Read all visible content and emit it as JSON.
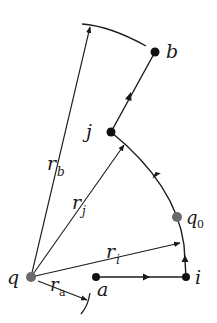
{
  "diagram": {
    "type": "physics-path-diagram",
    "colors": {
      "line": "#1a1a1a",
      "point_black": "#111111",
      "point_gray": "#6b6b6b",
      "background": "#ffffff"
    },
    "points": {
      "q": {
        "label": "q",
        "x": 31,
        "y": 277,
        "color": "gray"
      },
      "q0": {
        "label": "q",
        "sub": "0",
        "x": 177,
        "y": 217,
        "color": "gray"
      },
      "a": {
        "label": "a",
        "x": 96,
        "y": 277,
        "color": "black"
      },
      "i": {
        "label": "i",
        "x": 186,
        "y": 277,
        "color": "black"
      },
      "j": {
        "label": "j",
        "x": 111,
        "y": 132,
        "color": "black"
      },
      "b": {
        "label": "b",
        "x": 155,
        "y": 52,
        "color": "black"
      }
    },
    "vectors": {
      "rb": {
        "label": "r",
        "sub": "b"
      },
      "rj": {
        "label": "r",
        "sub": "j"
      },
      "ri": {
        "label": "r",
        "sub": "i"
      },
      "ra": {
        "label": "r",
        "sub": "a"
      }
    },
    "path": [
      "a",
      "i",
      "q0",
      "j",
      "b"
    ]
  }
}
